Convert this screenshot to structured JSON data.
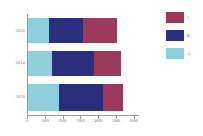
{
  "chart_data": {
    "type": "bar",
    "orientation": "horizontal",
    "stacked": true,
    "title": "",
    "xlabel": "",
    "ylabel": "",
    "categories": [
      "2010",
      "2014",
      "2018"
    ],
    "series": [
      {
        "name": "A",
        "color": "#8FCEDC",
        "values": [
          1200,
          1350,
          1750
        ]
      },
      {
        "name": "B",
        "color": "#2B2D7D",
        "values": [
          1900,
          2350,
          2450
        ]
      },
      {
        "name": "C",
        "color": "#9C3A5E",
        "values": [
          1900,
          1500,
          1100
        ]
      }
    ],
    "totals": [
      5000,
      5200,
      5300
    ],
    "xlim": [
      0,
      6000
    ],
    "xticks": [
      0,
      1000,
      2000,
      3000,
      4000,
      5000,
      6000
    ],
    "xticklabels": [
      "0",
      "1000",
      "2000",
      "3000",
      "4000",
      "5000",
      "6000"
    ],
    "grid": false,
    "legend_position": "right",
    "legend_order": [
      "C",
      "B",
      "A"
    ]
  },
  "colors": {
    "series_a": "#8FCEDC",
    "series_b": "#2B2D7D",
    "series_c": "#9C3A5E",
    "axis": "#9a9a9a",
    "text": "#7d7d7d",
    "background": "#ffffff"
  }
}
